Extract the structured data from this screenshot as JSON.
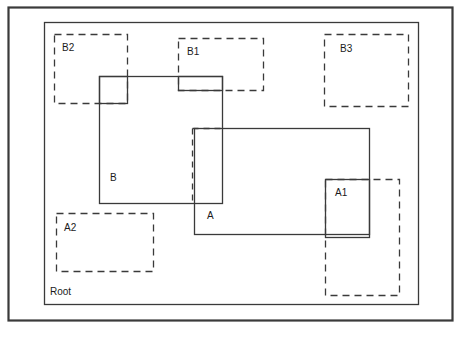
{
  "figure": {
    "type": "nested-rectangles-diagram",
    "background_color": "#ffffff",
    "stroke_color": "#3a3a3a",
    "text_color": "#1b1b1b",
    "label_font_size": 10,
    "width": 467,
    "height": 337
  },
  "outer_frame": {
    "name": "outer-frame",
    "style": "solid",
    "stroke_width": 2.2,
    "x": 8,
    "y": 7,
    "w": 444,
    "h": 313
  },
  "root": {
    "label": "Root",
    "style": "solid",
    "stroke_width": 1.3,
    "x": 44,
    "y": 22,
    "w": 374,
    "h": 282,
    "label_x": 50,
    "label_y": 295
  },
  "boxes": [
    {
      "label": "B2",
      "name": "box-b2",
      "style": "dashed",
      "x": 54,
      "y": 34,
      "w": 73,
      "h": 69,
      "label_x": 62,
      "label_y": 51
    },
    {
      "label": "B1",
      "name": "box-b1",
      "style": "dashed",
      "x": 178,
      "y": 38,
      "w": 85,
      "h": 52,
      "label_x": 187,
      "label_y": 55
    },
    {
      "label": "B3",
      "name": "box-b3",
      "style": "dashed",
      "x": 324,
      "y": 34,
      "w": 84,
      "h": 72,
      "label_x": 340,
      "label_y": 52
    },
    {
      "label": "A2",
      "name": "box-a2",
      "style": "dashed",
      "x": 56,
      "y": 213,
      "w": 97,
      "h": 58,
      "label_x": 64,
      "label_y": 231
    },
    {
      "label": "",
      "name": "box-a1-dashed-extent",
      "style": "dashed",
      "x": 325,
      "y": 179,
      "w": 74,
      "h": 116,
      "label_x": 0,
      "label_y": 0
    },
    {
      "label": "B",
      "name": "box-b",
      "style": "solid",
      "x": 99,
      "y": 76,
      "w": 123,
      "h": 127,
      "label_x": 110,
      "label_y": 181
    },
    {
      "label": "A",
      "name": "box-a",
      "style": "solid",
      "x": 194,
      "y": 128,
      "w": 175,
      "h": 106,
      "label_x": 207,
      "label_y": 219
    },
    {
      "label": "A1",
      "name": "box-a1",
      "style": "solid",
      "x": 325,
      "y": 179,
      "w": 44,
      "h": 58,
      "label_x": 335,
      "label_y": 196
    }
  ],
  "overlap_outlines": [
    {
      "name": "overlap-b-b2",
      "note": "small square where B overlaps B2",
      "x": 99,
      "y": 76,
      "w": 28,
      "h": 27
    },
    {
      "name": "overlap-b-b1",
      "note": "small strip where B overlaps B1",
      "x": 178,
      "y": 76,
      "w": 44,
      "h": 14
    }
  ],
  "partial_edges": [
    {
      "name": "edge-a-left-dashed",
      "note": "dashed left edge of A inside B",
      "x1": 192,
      "y1": 128,
      "x2": 192,
      "y2": 203
    },
    {
      "name": "edge-a-top-dashed",
      "note": "dashed top edge of A inside B",
      "x1": 192,
      "y1": 128,
      "x2": 222,
      "y2": 128
    }
  ]
}
